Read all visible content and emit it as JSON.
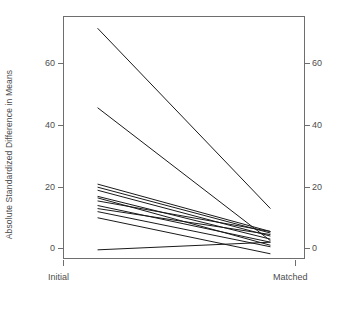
{
  "chart_data": {
    "type": "line",
    "title": "",
    "subtitle": "",
    "xlabel": "",
    "ylabel": "Absolute Standardized Difference in Means",
    "categories": [
      "Initial",
      "Matched"
    ],
    "x": [
      0,
      1
    ],
    "xlim": [
      -0.2,
      1.2
    ],
    "ylim": [
      -1.5,
      78
    ],
    "yticks": [
      0,
      20,
      40,
      60
    ],
    "ytick_labels": [
      "0",
      "20",
      "40",
      "60"
    ],
    "xtick_labels": [
      "Initial",
      "Matched"
    ],
    "grid": false,
    "legend": "none",
    "axis_box": true,
    "right_axis": true,
    "line_color": "#1a1a1a",
    "background": "#ffffff",
    "series": [
      {
        "name": "covariate-1",
        "values": [
          74.0,
          15.0
        ]
      },
      {
        "name": "covariate-2",
        "values": [
          48.0,
          4.5
        ]
      },
      {
        "name": "covariate-3",
        "values": [
          23.0,
          7.5
        ]
      },
      {
        "name": "covariate-4",
        "values": [
          22.0,
          7.0
        ]
      },
      {
        "name": "covariate-5",
        "values": [
          21.0,
          6.0
        ]
      },
      {
        "name": "covariate-6",
        "values": [
          19.0,
          5.0
        ]
      },
      {
        "name": "covariate-7",
        "values": [
          18.5,
          3.0
        ]
      },
      {
        "name": "covariate-8",
        "values": [
          17.5,
          7.5
        ]
      },
      {
        "name": "covariate-9",
        "values": [
          16.0,
          4.0
        ]
      },
      {
        "name": "covariate-10",
        "values": [
          15.0,
          6.5
        ]
      },
      {
        "name": "covariate-11",
        "values": [
          14.0,
          2.5
        ]
      },
      {
        "name": "covariate-12",
        "values": [
          12.0,
          0.2
        ]
      },
      {
        "name": "covariate-13",
        "values": [
          1.5,
          4.0
        ]
      }
    ]
  },
  "axis": {
    "y_title": "Absolute Standardized Difference in Means",
    "y_ticks_left": [
      "60",
      "40",
      "20",
      "0"
    ],
    "y_ticks_right": [
      "60",
      "40",
      "20",
      "0"
    ],
    "x_tick_initial": "Initial",
    "x_tick_matched": "Matched"
  }
}
